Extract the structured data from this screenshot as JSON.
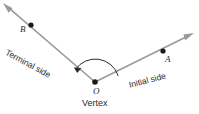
{
  "figure": {
    "type": "geometry-angle-diagram",
    "background_color": "#ffffff",
    "ray_color": "#9a9a9a",
    "point_color": "#1a1a1a",
    "arc_color": "#2b2b2b",
    "text_color": "#2b2b2b",
    "labels": {
      "point_b": "B",
      "point_a": "A",
      "vertex_point": "O",
      "vertex_caption": "Vertex",
      "terminal_side": "Terminal side",
      "initial_side": "Initial side"
    },
    "geometry": {
      "vertex": [
        95,
        82
      ],
      "terminal_ray_tip": [
        3,
        3
      ],
      "initial_ray_tip": [
        194,
        33
      ],
      "point_b": [
        31,
        25
      ],
      "point_a": [
        163,
        51
      ],
      "arc_radius": 24,
      "arc_direction": "counterclockwise",
      "arc_start_angle_deg": -14.5,
      "arc_end_angle_deg": -149
    }
  }
}
